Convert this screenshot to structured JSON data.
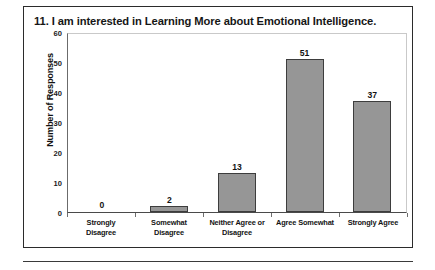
{
  "figure": {
    "title": "11. I am interested in Learning More about Emotional Intelligence."
  },
  "chart_data": {
    "type": "bar",
    "title": "11. I am interested in Learning More about Emotional Intelligence.",
    "xlabel": "",
    "ylabel": "Number of Responses",
    "categories": [
      "Strongly Disagree",
      "Somewhat Disagree",
      "Neither Agree or Disagree",
      "Agree Somewhat",
      "Strongly Agree"
    ],
    "category_lines": [
      [
        "Strongly",
        "Disagree"
      ],
      [
        "Somewhat",
        "Disagree"
      ],
      [
        "Neither Agree or",
        "Disagree"
      ],
      [
        "Agree Somewhat",
        ""
      ],
      [
        "Strongly Agree",
        ""
      ]
    ],
    "values": [
      0,
      2,
      13,
      51,
      37
    ],
    "value_labels": [
      "0",
      "2",
      "13",
      "51",
      "37"
    ],
    "ylim": [
      0,
      60
    ],
    "ytick_values": [
      0,
      10,
      20,
      30,
      40,
      50,
      60
    ],
    "ytick_labels": [
      "0",
      "10",
      "20",
      "30",
      "40",
      "50",
      "60"
    ],
    "grid": false,
    "legend": false,
    "bar_color": "#969696",
    "bar_border_color": "#3d3d3d"
  }
}
